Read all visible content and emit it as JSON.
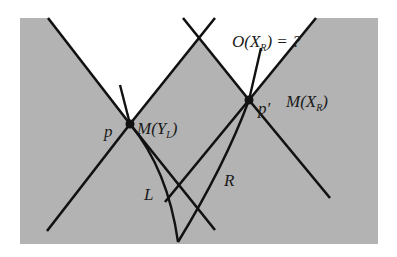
{
  "diagram": {
    "background_color": "#b3b3b3",
    "line_color": "#111111",
    "labels": {
      "p": "p",
      "p_prime": "p′",
      "M_left_prefix": "M(Y",
      "M_left_sub": "L",
      "M_left_suffix": ")",
      "M_right_prefix": "M(X",
      "M_right_sub": "R",
      "M_right_suffix": ")",
      "O_prefix": "O(X",
      "O_sub": "R",
      "O_suffix": ") = ?",
      "L": "L",
      "R": "R"
    },
    "points": {
      "p": {
        "x": 130,
        "y": 124
      },
      "p_prime": {
        "x": 249,
        "y": 100
      }
    }
  }
}
